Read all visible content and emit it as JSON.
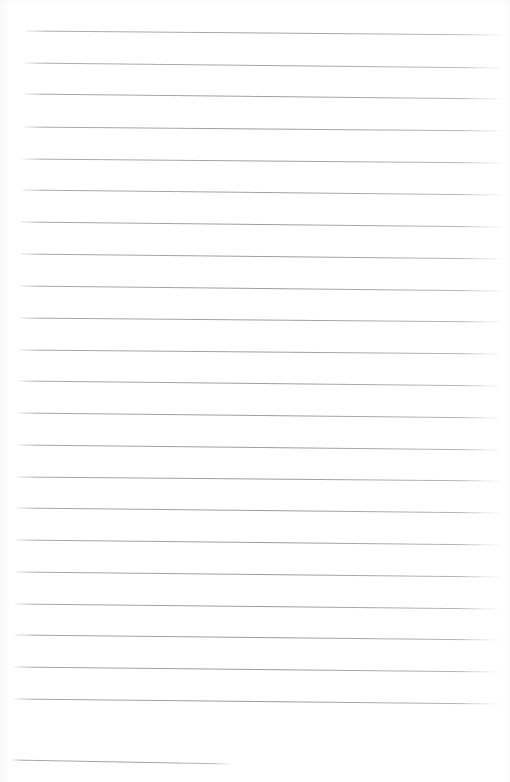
{
  "document": {
    "kind": "scanned-ruled-paper",
    "title": "Blank Ruled Notebook Page",
    "visible_text": "",
    "page_width": 510,
    "page_height": 782,
    "background_color": "#ffffff",
    "rule_color": "#9a9a9e",
    "rule_color_faint": "#c9c9cf",
    "rule_thickness": 0.9,
    "orientation": "portrait",
    "left_margin_present": false,
    "margin_rule_present": false,
    "handwriting_present": false,
    "printed_text_present": false,
    "rule_count": 23
  },
  "ruling": {
    "style": "horizontal ruled lines, slightly rotated from scan skew",
    "nominal_spacing": 32,
    "skew_note": "lines drop about 3-4px from left end to right end",
    "lines": [
      {
        "index": 1,
        "x1": 26,
        "y1": 31,
        "x2": 501,
        "y2": 35,
        "opacity": 0.85
      },
      {
        "index": 2,
        "x1": 25,
        "y1": 63,
        "x2": 501,
        "y2": 68,
        "opacity": 0.85
      },
      {
        "index": 3,
        "x1": 24,
        "y1": 94,
        "x2": 502,
        "y2": 99,
        "opacity": 0.9
      },
      {
        "index": 4,
        "x1": 24,
        "y1": 127,
        "x2": 502,
        "y2": 131,
        "opacity": 0.9
      },
      {
        "index": 5,
        "x1": 23,
        "y1": 159,
        "x2": 501,
        "y2": 163,
        "opacity": 0.88
      },
      {
        "index": 6,
        "x1": 22,
        "y1": 190,
        "x2": 501,
        "y2": 195,
        "opacity": 0.88
      },
      {
        "index": 7,
        "x1": 21,
        "y1": 222,
        "x2": 501,
        "y2": 227,
        "opacity": 0.9
      },
      {
        "index": 8,
        "x1": 21,
        "y1": 254,
        "x2": 502,
        "y2": 259,
        "opacity": 0.9
      },
      {
        "index": 9,
        "x1": 20,
        "y1": 286,
        "x2": 501,
        "y2": 291,
        "opacity": 0.9
      },
      {
        "index": 10,
        "x1": 20,
        "y1": 318,
        "x2": 501,
        "y2": 322,
        "opacity": 0.9
      },
      {
        "index": 11,
        "x1": 19,
        "y1": 350,
        "x2": 500,
        "y2": 354,
        "opacity": 0.9
      },
      {
        "index": 12,
        "x1": 19,
        "y1": 381,
        "x2": 500,
        "y2": 386,
        "opacity": 0.9
      },
      {
        "index": 13,
        "x1": 18,
        "y1": 413,
        "x2": 500,
        "y2": 418,
        "opacity": 0.92
      },
      {
        "index": 14,
        "x1": 18,
        "y1": 445,
        "x2": 500,
        "y2": 450,
        "opacity": 0.92
      },
      {
        "index": 15,
        "x1": 17,
        "y1": 477,
        "x2": 499,
        "y2": 481,
        "opacity": 0.92
      },
      {
        "index": 16,
        "x1": 17,
        "y1": 508,
        "x2": 499,
        "y2": 513,
        "opacity": 0.92
      },
      {
        "index": 17,
        "x1": 16,
        "y1": 540,
        "x2": 499,
        "y2": 545,
        "opacity": 0.92
      },
      {
        "index": 18,
        "x1": 16,
        "y1": 572,
        "x2": 499,
        "y2": 577,
        "opacity": 0.92
      },
      {
        "index": 19,
        "x1": 15,
        "y1": 604,
        "x2": 498,
        "y2": 609,
        "opacity": 0.92
      },
      {
        "index": 20,
        "x1": 15,
        "y1": 635,
        "x2": 498,
        "y2": 640,
        "opacity": 0.92
      },
      {
        "index": 21,
        "x1": 14,
        "y1": 667,
        "x2": 498,
        "y2": 672,
        "opacity": 0.92
      },
      {
        "index": 22,
        "x1": 14,
        "y1": 699,
        "x2": 498,
        "y2": 704,
        "opacity": 0.92
      },
      {
        "index": 23,
        "x1": 12,
        "y1": 760,
        "x2": 232,
        "y2": 764,
        "opacity": 0.9
      }
    ]
  }
}
